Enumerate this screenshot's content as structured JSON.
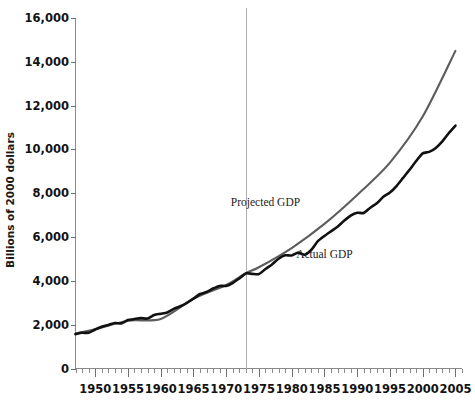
{
  "chart_data": {
    "type": "line",
    "title": "",
    "xlabel": "",
    "ylabel": "Billions of 2000 dollars",
    "xlim": [
      1947,
      2006
    ],
    "ylim": [
      0,
      16000
    ],
    "ytick_step": 2000,
    "xtick_step": 5,
    "xtick_minor_step": 1,
    "grid": false,
    "legend_position": "inline-annotations",
    "yticks": [
      "0",
      "2,000",
      "4,000",
      "6,000",
      "8,000",
      "10,000",
      "12,000",
      "14,000",
      "16,000"
    ],
    "ytick_values": [
      0,
      2000,
      4000,
      6000,
      8000,
      10000,
      12000,
      14000,
      16000
    ],
    "xticks": [
      "1950",
      "1955",
      "1960",
      "1965",
      "1970",
      "1975",
      "1980",
      "1985",
      "1990",
      "1995",
      "2000",
      "2005"
    ],
    "xtick_values": [
      1950,
      1955,
      1960,
      1965,
      1970,
      1975,
      1980,
      1985,
      1990,
      1995,
      2000,
      2005
    ],
    "annotations": [
      {
        "text": "Projected GDP",
        "x": 1976,
        "y": 7400,
        "name": "projected-gdp-label"
      },
      {
        "text": "Actual GDP",
        "x": 1985,
        "y": 5050,
        "name": "actual-gdp-label"
      }
    ],
    "reference_lines": [
      {
        "orientation": "vertical",
        "x": 1973,
        "color": "#b0b0b0",
        "name": "divergence-reference-line"
      }
    ],
    "series": [
      {
        "name": "Actual GDP",
        "color": "#111111",
        "x": [
          1947,
          1948,
          1949,
          1950,
          1951,
          1952,
          1953,
          1954,
          1955,
          1956,
          1957,
          1958,
          1959,
          1960,
          1961,
          1962,
          1963,
          1964,
          1965,
          1966,
          1967,
          1968,
          1969,
          1970,
          1971,
          1972,
          1973,
          1974,
          1975,
          1976,
          1977,
          1978,
          1979,
          1980,
          1981,
          1982,
          1983,
          1984,
          1985,
          1986,
          1987,
          1988,
          1989,
          1990,
          1991,
          1992,
          1993,
          1994,
          1995,
          1996,
          1997,
          1998,
          1999,
          2000,
          2001,
          2002,
          2003,
          2004,
          2005
        ],
        "values": [
          1570,
          1630,
          1630,
          1780,
          1910,
          1990,
          2080,
          2060,
          2210,
          2260,
          2300,
          2280,
          2440,
          2500,
          2560,
          2720,
          2840,
          3000,
          3190,
          3400,
          3490,
          3650,
          3770,
          3770,
          3900,
          4110,
          4340,
          4320,
          4310,
          4540,
          4750,
          5010,
          5170,
          5160,
          5290,
          5190,
          5420,
          5810,
          6050,
          6260,
          6470,
          6740,
          6980,
          7110,
          7100,
          7340,
          7540,
          7840,
          8030,
          8330,
          8700,
          9070,
          9470,
          9820,
          9890,
          10070,
          10370,
          10750,
          11090
        ]
      },
      {
        "name": "Projected GDP",
        "color": "#5c5c5c",
        "x": [
          1947,
          1950,
          1955,
          1960,
          1965,
          1970,
          1973,
          1975,
          1980,
          1985,
          1990,
          1995,
          2000,
          2005
        ],
        "values": [
          1600,
          1790,
          2180,
          2260,
          3180,
          3810,
          4350,
          4620,
          5500,
          6600,
          7920,
          9400,
          11500,
          14500
        ]
      }
    ]
  }
}
